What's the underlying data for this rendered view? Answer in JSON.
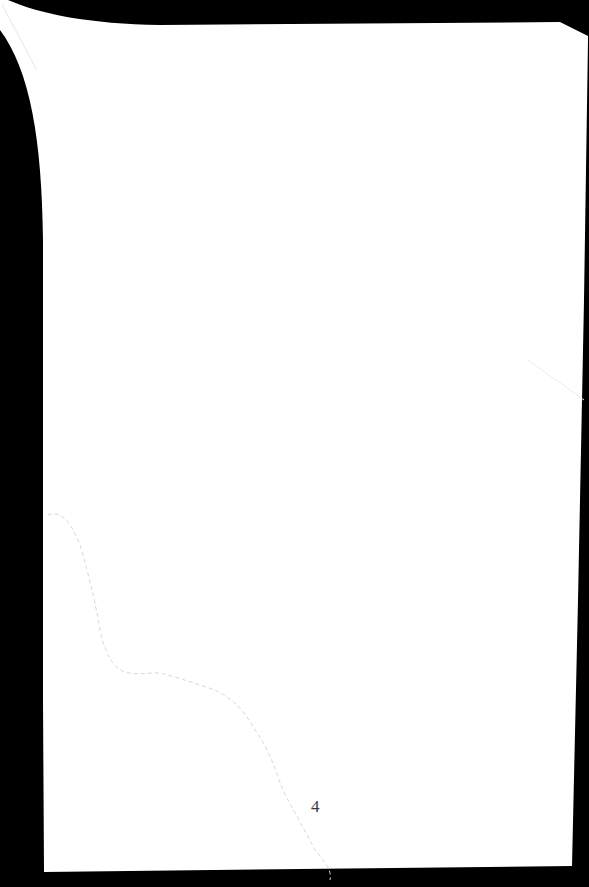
{
  "document": {
    "type": "scanned-page",
    "page_number": "4",
    "colors": {
      "background": "#000000",
      "paper": "#ffffff",
      "crease": "#d8d8d8",
      "text": "#3a3a3a"
    }
  }
}
